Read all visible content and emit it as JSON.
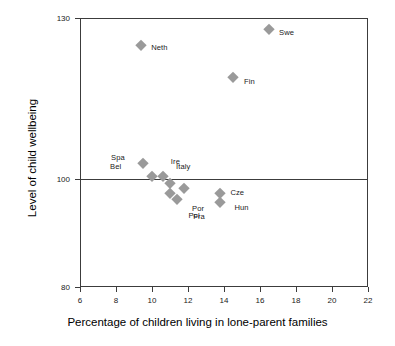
{
  "chart_data": {
    "type": "scatter",
    "title": "",
    "xlabel": "Percentage of children living in lone-parent families",
    "ylabel": "Level of child wellbeing",
    "xlim": [
      6,
      22
    ],
    "ylim": [
      80,
      130
    ],
    "xticks": [
      6,
      8,
      10,
      12,
      14,
      16,
      18,
      20,
      22
    ],
    "yticks": [
      80,
      100,
      130
    ],
    "grid": false,
    "legend": "none",
    "reference_lines": [
      {
        "axis": "y",
        "value": 100,
        "label": ""
      }
    ],
    "marker_style": "diamond",
    "marker_color": "#9a9a9a",
    "points": [
      {
        "label": "Neth",
        "x": 9.4,
        "y": 125.0,
        "label_dx": 10,
        "label_dy": 3
      },
      {
        "label": "Swe",
        "x": 16.5,
        "y": 128.0,
        "label_dx": 10,
        "label_dy": 4
      },
      {
        "label": "Fin",
        "x": 14.5,
        "y": 119.0,
        "label_dx": 11,
        "label_dy": 5
      },
      {
        "label": "Spa",
        "x": 9.5,
        "y": 103.0,
        "label_dx": -32,
        "label_dy": -5
      },
      {
        "label": "Bel",
        "x": 10.0,
        "y": 100.6,
        "label_dx": -42,
        "label_dy": -9
      },
      {
        "label": "Ire",
        "x": 10.6,
        "y": 100.6,
        "label_dx": 8,
        "label_dy": -14
      },
      {
        "label": "Italy",
        "x": 11.0,
        "y": 99.3,
        "label_dx": 6,
        "label_dy": -16
      },
      {
        "label": "Por",
        "x": 11.0,
        "y": 97.4,
        "label_dx": 22,
        "label_dy": 16
      },
      {
        "label": "Fra",
        "x": 11.4,
        "y": 96.4,
        "label_dx": 16,
        "label_dy": 18
      },
      {
        "label": "Pol",
        "x": 11.8,
        "y": 98.4,
        "label_dx": 4,
        "label_dy": 28
      },
      {
        "label": "Cze",
        "x": 13.8,
        "y": 97.4,
        "label_dx": 10,
        "label_dy": 0
      },
      {
        "label": "Hun",
        "x": 13.8,
        "y": 95.8,
        "label_dx": 14,
        "label_dy": 6
      }
    ]
  },
  "axes": {
    "x_title": "Percentage of children living in lone-parent families",
    "y_title": "Level of child wellbeing",
    "x_tick_labels": [
      "6",
      "8",
      "10",
      "12",
      "14",
      "16",
      "18",
      "20",
      "22"
    ],
    "y_tick_labels": [
      "130",
      "100",
      "80"
    ]
  },
  "colors": {
    "marker": "#9a9a9a",
    "frame": "#3c3c3c",
    "text": "#000000",
    "background": "#ffffff"
  }
}
